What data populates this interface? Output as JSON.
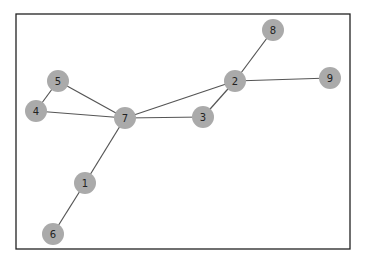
{
  "diagram": {
    "type": "network-graph",
    "frame": {
      "x": 16,
      "y": 14,
      "width": 334,
      "height": 235
    },
    "node_radius": 11,
    "colors": {
      "node_fill": "#aaaaaa",
      "edge": "#555555",
      "label": "#222222",
      "frame": "#222222",
      "background": "#ffffff"
    },
    "nodes": [
      {
        "id": "1",
        "label": "1",
        "x": 85,
        "y": 183
      },
      {
        "id": "2",
        "label": "2",
        "x": 235,
        "y": 81
      },
      {
        "id": "3",
        "label": "3",
        "x": 203,
        "y": 117
      },
      {
        "id": "4",
        "label": "4",
        "x": 36,
        "y": 111
      },
      {
        "id": "5",
        "label": "5",
        "x": 58,
        "y": 81
      },
      {
        "id": "6",
        "label": "6",
        "x": 53,
        "y": 234
      },
      {
        "id": "7",
        "label": "7",
        "x": 125,
        "y": 118
      },
      {
        "id": "8",
        "label": "8",
        "x": 273,
        "y": 30
      },
      {
        "id": "9",
        "label": "9",
        "x": 330,
        "y": 78
      }
    ],
    "edges": [
      {
        "source": "5",
        "target": "4"
      },
      {
        "source": "5",
        "target": "7"
      },
      {
        "source": "4",
        "target": "7"
      },
      {
        "source": "7",
        "target": "3"
      },
      {
        "source": "7",
        "target": "2"
      },
      {
        "source": "7",
        "target": "1"
      },
      {
        "source": "1",
        "target": "6"
      },
      {
        "source": "3",
        "target": "2"
      },
      {
        "source": "2",
        "target": "8"
      },
      {
        "source": "2",
        "target": "9"
      }
    ]
  }
}
